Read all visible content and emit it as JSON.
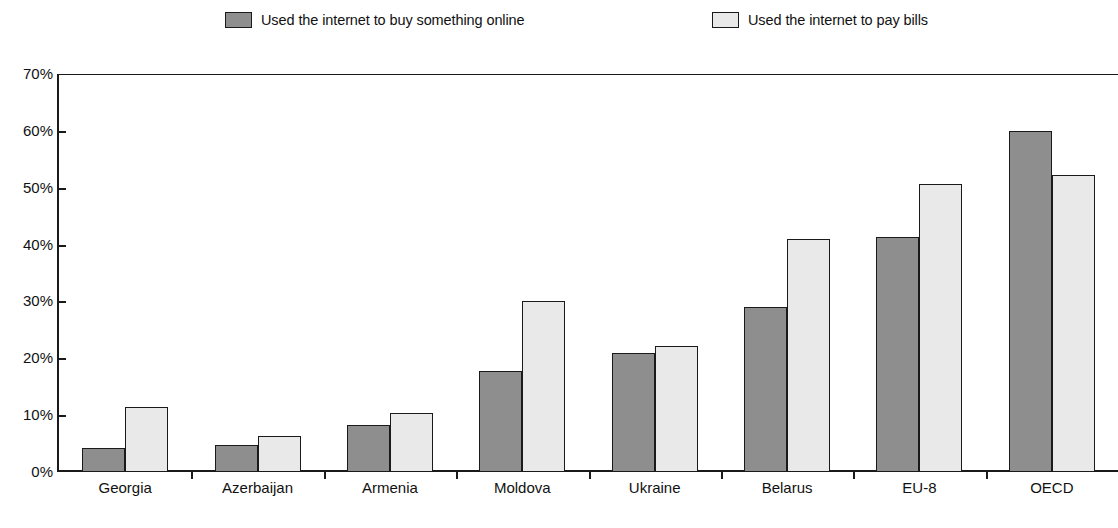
{
  "legend": {
    "position": "top",
    "entries": [
      {
        "label": "Used the internet to buy something online",
        "color": "#8e8e8e",
        "swatch_name": "legend-swatch-buy-online"
      },
      {
        "label": "Used the internet to pay bills",
        "color": "#e9e9e9",
        "swatch_name": "legend-swatch-pay-bills"
      }
    ]
  },
  "chart_data": {
    "type": "bar",
    "title": "",
    "subtitle": "",
    "xlabel": "",
    "ylabel": "",
    "ylim": [
      0,
      70
    ],
    "ytick_labels": [
      "70%",
      "60%",
      "50%",
      "40%",
      "30%",
      "20%",
      "10%",
      "0%"
    ],
    "ytick_values": [
      70,
      60,
      50,
      40,
      30,
      20,
      10,
      0
    ],
    "grid": false,
    "legend_position": "top",
    "categories": [
      "Georgia",
      "Azerbaijan",
      "Armenia",
      "Moldova",
      "Ukraine",
      "Belarus",
      "EU-8",
      "OECD"
    ],
    "series": [
      {
        "name": "Used the internet to buy something online",
        "color": "#8e8e8e",
        "values": [
          4.3,
          4.7,
          8.2,
          17.8,
          21.0,
          29.0,
          41.4,
          60.0
        ]
      },
      {
        "name": "Used the internet to pay bills",
        "color": "#e9e9e9",
        "values": [
          11.5,
          6.4,
          10.3,
          30.1,
          22.1,
          41.0,
          50.6,
          52.3
        ]
      }
    ]
  },
  "colors": {
    "series_dark": "#8e8e8e",
    "series_light": "#e9e9e9",
    "axis": "#1a1a1a",
    "background": "#ffffff"
  }
}
